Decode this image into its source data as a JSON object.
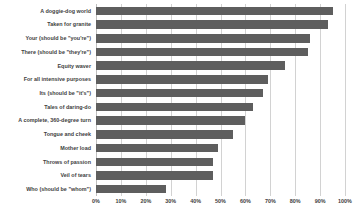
{
  "chart_data": {
    "type": "bar",
    "orientation": "horizontal",
    "title": "",
    "xlabel": "",
    "ylabel": "",
    "xlim": [
      0,
      100
    ],
    "grid": true,
    "legend": false,
    "bar_color": "#5e5e5e",
    "gridline_color": "#d2d2d2",
    "tick_suffix": "%",
    "xticks": [
      0,
      10,
      20,
      30,
      40,
      50,
      60,
      70,
      80,
      90,
      100
    ],
    "xticklabels": [
      "0%",
      "10%",
      "20%",
      "30%",
      "40%",
      "50%",
      "60%",
      "70%",
      "80%",
      "90%",
      "100%"
    ],
    "categories": [
      "A doggie-dog world",
      "Taken for granite",
      "Your (should be \"you're\")",
      "There (should be \"they're\")",
      "Equity waver",
      "For all intensive purposes",
      "Its (should be \"it's\")",
      "Tales of daring-do",
      "A complete, 360-degree turn",
      "Tongue and cheek",
      "Mother load",
      "Throws of passion",
      "Veil of tears",
      "Who (should be \"whom\")"
    ],
    "values": [
      95,
      93,
      86,
      85,
      76,
      69,
      67,
      63,
      60,
      55,
      49,
      47,
      47,
      28
    ]
  }
}
